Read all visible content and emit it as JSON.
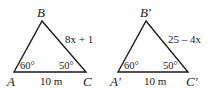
{
  "figures": [
    {
      "name": "triangle-ABC",
      "vertices": {
        "A": "A",
        "B": "B",
        "C": "C"
      },
      "side_AC": "10 m",
      "side_BC": "8x + 1",
      "angle_A": "60°",
      "angle_C": "50°"
    },
    {
      "name": "triangle-A'B'C'",
      "vertices": {
        "A": "A′",
        "B": "B′",
        "C": "C′"
      },
      "side_AC": "10 m",
      "side_BC": "25 – 4x",
      "angle_A": "60°",
      "angle_C": "50°"
    }
  ],
  "colors": {
    "stroke": "#1a1a1a",
    "background": "#ffffff"
  }
}
